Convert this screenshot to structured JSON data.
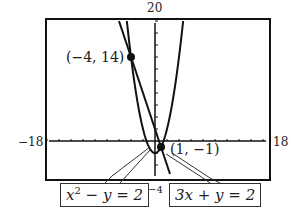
{
  "chart_data": {
    "type": "line",
    "title": "",
    "xlabel": "",
    "ylabel": "",
    "xlim": [
      -18,
      18
    ],
    "ylim": [
      -4,
      20
    ],
    "grid": false,
    "window_labels": {
      "ymax": "20",
      "ymin": "-4",
      "xmin": "-18",
      "xmax": "18"
    },
    "series": [
      {
        "name": "x^2 - y = 2",
        "equation": "y = x^2 - 2"
      },
      {
        "name": "3x + y = 2",
        "equation": "y = 2 - 3x"
      }
    ],
    "intersection_points": [
      {
        "label": "(-4, 14)",
        "x": -4,
        "y": 14
      },
      {
        "label": "(1, -1)",
        "x": 1,
        "y": -1
      }
    ],
    "annotations": [
      "x² - y = 2",
      "3x + y = 2",
      "(-4, 14)",
      "(1, -1)"
    ]
  },
  "labels": {
    "ymax": "20",
    "ymin": "−4",
    "xmin": "−18",
    "xmax": "18",
    "point1": "(−4, 14)",
    "point2": "(1, −1)",
    "eq1_base": "x",
    "eq1_exp": "2",
    "eq1_rest": " − y = 2",
    "eq2": "3x + y = 2"
  }
}
